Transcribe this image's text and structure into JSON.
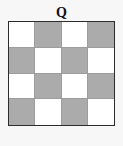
{
  "figure": {
    "label": "Q",
    "colors": {
      "background": "#f7f7f8",
      "shaded_cell": "#ababab",
      "light_cell": "#ffffff",
      "outer_border": "#2c2c2c",
      "grid_line": "#9d9d9d",
      "label_color": "#111111"
    }
  },
  "chart_data": {
    "type": "heatmap",
    "title": "Q",
    "xlabel": "",
    "ylabel": "",
    "rows": 4,
    "cols": 4,
    "grid": true,
    "legend": null,
    "value_labels": {
      "0": "light",
      "1": "shaded"
    },
    "values": [
      [
        0,
        1,
        0,
        1
      ],
      [
        1,
        0,
        1,
        0
      ],
      [
        0,
        1,
        0,
        1
      ],
      [
        1,
        0,
        1,
        0
      ]
    ],
    "cells": [
      {
        "row": 0,
        "col": 0,
        "fill": "light"
      },
      {
        "row": 0,
        "col": 1,
        "fill": "shaded"
      },
      {
        "row": 0,
        "col": 2,
        "fill": "light"
      },
      {
        "row": 0,
        "col": 3,
        "fill": "shaded"
      },
      {
        "row": 1,
        "col": 0,
        "fill": "shaded"
      },
      {
        "row": 1,
        "col": 1,
        "fill": "light"
      },
      {
        "row": 1,
        "col": 2,
        "fill": "shaded"
      },
      {
        "row": 1,
        "col": 3,
        "fill": "light"
      },
      {
        "row": 2,
        "col": 0,
        "fill": "light"
      },
      {
        "row": 2,
        "col": 1,
        "fill": "shaded"
      },
      {
        "row": 2,
        "col": 2,
        "fill": "light"
      },
      {
        "row": 2,
        "col": 3,
        "fill": "shaded"
      },
      {
        "row": 3,
        "col": 0,
        "fill": "shaded"
      },
      {
        "row": 3,
        "col": 1,
        "fill": "light"
      },
      {
        "row": 3,
        "col": 2,
        "fill": "shaded"
      },
      {
        "row": 3,
        "col": 3,
        "fill": "light"
      }
    ]
  }
}
